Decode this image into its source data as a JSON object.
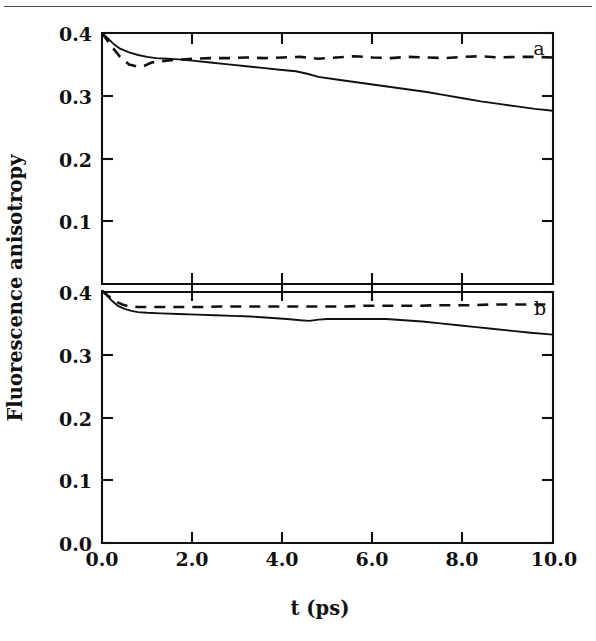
{
  "figure": {
    "top_rule": true,
    "x_axis_title": "t (ps)",
    "y_axis_title": "Fluorescence anisotropy",
    "panel_a_tag": "a",
    "panel_b_tag": "b",
    "x_tick_labels": [
      "0.0",
      "2.0",
      "4.0",
      "6.0",
      "8.0",
      "10.0"
    ],
    "y_tick_labels_a": [
      "0.4",
      "0.3",
      "0.2",
      "0.1"
    ],
    "y_tick_labels_b": [
      "0.4",
      "0.3",
      "0.2",
      "0.1",
      "0.0"
    ],
    "ink_color": "#111111",
    "rule_color": "#4a4a4a",
    "background_color": "#ffffff"
  },
  "chart_data": {
    "type": "line",
    "title": "",
    "xlabel": "t (ps)",
    "ylabel": "Fluorescence anisotropy",
    "xlim": [
      0.0,
      10.0
    ],
    "ylim": [
      0.0,
      0.4
    ],
    "xticks": [
      0.0,
      2.0,
      4.0,
      6.0,
      8.0,
      10.0
    ],
    "yticks": [
      0.0,
      0.1,
      0.2,
      0.3,
      0.4
    ],
    "grid": false,
    "legend": "none",
    "panels": [
      {
        "tag": "a",
        "annotation": "a",
        "yticks_shown": [
          0.1,
          0.2,
          0.3,
          0.4
        ],
        "series": [
          {
            "name": "solid",
            "style": "solid",
            "x": [
              0.0,
              0.12,
              0.25,
              0.4,
              0.6,
              0.8,
              1.0,
              1.2,
              1.45,
              1.7,
              2.0,
              2.4,
              2.8,
              3.2,
              3.6,
              4.0,
              4.3,
              4.55,
              4.8,
              5.2,
              5.6,
              6.0,
              6.4,
              6.8,
              7.2,
              7.6,
              8.0,
              8.4,
              8.8,
              9.2,
              9.6,
              10.0
            ],
            "y": [
              0.4,
              0.392,
              0.383,
              0.375,
              0.369,
              0.365,
              0.362,
              0.36,
              0.359,
              0.358,
              0.356,
              0.353,
              0.35,
              0.347,
              0.344,
              0.341,
              0.339,
              0.335,
              0.33,
              0.326,
              0.322,
              0.318,
              0.314,
              0.31,
              0.306,
              0.301,
              0.296,
              0.291,
              0.287,
              0.283,
              0.279,
              0.276
            ]
          },
          {
            "name": "dashed",
            "style": "dashed",
            "x": [
              0.0,
              0.2,
              0.4,
              0.6,
              0.8,
              0.95,
              1.1,
              1.3,
              1.6,
              2.0,
              2.4,
              2.8,
              3.2,
              3.6,
              4.0,
              4.4,
              4.8,
              5.2,
              5.6,
              6.0,
              6.4,
              6.8,
              7.2,
              7.6,
              8.0,
              8.4,
              8.8,
              9.2,
              9.6,
              10.0
            ],
            "y": [
              0.4,
              0.38,
              0.362,
              0.35,
              0.346,
              0.348,
              0.353,
              0.355,
              0.357,
              0.359,
              0.36,
              0.36,
              0.361,
              0.36,
              0.361,
              0.362,
              0.359,
              0.361,
              0.363,
              0.361,
              0.36,
              0.362,
              0.361,
              0.36,
              0.362,
              0.363,
              0.361,
              0.362,
              0.362,
              0.361
            ]
          }
        ]
      },
      {
        "tag": "b",
        "annotation": "b",
        "yticks_shown": [
          0.0,
          0.1,
          0.2,
          0.3,
          0.4
        ],
        "series": [
          {
            "name": "solid",
            "style": "solid",
            "x": [
              0.0,
              0.1,
              0.22,
              0.35,
              0.5,
              0.65,
              0.8,
              1.0,
              1.3,
              1.7,
              2.1,
              2.5,
              2.9,
              3.3,
              3.7,
              4.1,
              4.4,
              4.6,
              4.8,
              5.0,
              5.3,
              5.7,
              6.0,
              6.3,
              6.7,
              7.1,
              7.5,
              7.9,
              8.3,
              8.7,
              9.1,
              9.5,
              10.0
            ],
            "y": [
              0.402,
              0.395,
              0.386,
              0.378,
              0.373,
              0.37,
              0.368,
              0.367,
              0.366,
              0.365,
              0.364,
              0.363,
              0.362,
              0.361,
              0.359,
              0.357,
              0.355,
              0.354,
              0.356,
              0.357,
              0.357,
              0.357,
              0.357,
              0.357,
              0.355,
              0.353,
              0.35,
              0.347,
              0.344,
              0.341,
              0.338,
              0.335,
              0.332
            ]
          },
          {
            "name": "dashed",
            "style": "dashed",
            "x": [
              0.0,
              0.15,
              0.3,
              0.45,
              0.6,
              0.8,
              1.0,
              1.4,
              1.8,
              2.2,
              2.6,
              3.0,
              3.4,
              3.8,
              4.2,
              4.6,
              5.0,
              5.4,
              5.8,
              6.2,
              6.6,
              7.0,
              7.4,
              7.8,
              8.2,
              8.6,
              9.0,
              9.4,
              10.0
            ],
            "y": [
              0.402,
              0.393,
              0.385,
              0.38,
              0.377,
              0.376,
              0.376,
              0.376,
              0.376,
              0.376,
              0.377,
              0.377,
              0.377,
              0.377,
              0.377,
              0.377,
              0.377,
              0.377,
              0.378,
              0.378,
              0.378,
              0.378,
              0.379,
              0.379,
              0.379,
              0.38,
              0.38,
              0.38,
              0.38
            ]
          }
        ]
      }
    ]
  }
}
